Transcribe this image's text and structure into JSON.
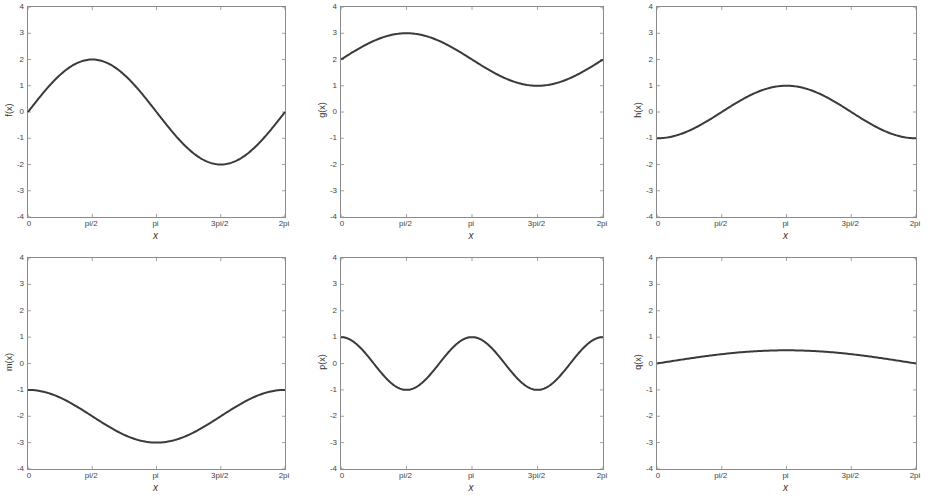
{
  "chart_data": [
    {
      "type": "line",
      "panel": "top-left",
      "ylabel": "f(x)",
      "xlabel": "x",
      "expression": "2*sin(x)",
      "xticks": [
        "0",
        "pi/2",
        "pi",
        "3pi/2",
        "2pi"
      ],
      "yticks": [
        "4",
        "3",
        "2",
        "1",
        "0",
        "-1",
        "-2",
        "-3",
        "-4"
      ],
      "xlim": [
        0,
        6.2832
      ],
      "ylim": [
        -4,
        4
      ],
      "x": [
        0,
        1.5708,
        3.1416,
        4.7124,
        6.2832
      ],
      "values": [
        0,
        2,
        0,
        -2,
        0
      ]
    },
    {
      "type": "line",
      "panel": "top-middle",
      "ylabel": "g(x)",
      "xlabel": "x",
      "expression": "2+sin(x)",
      "xticks": [
        "0",
        "pi/2",
        "pi",
        "3pi/2",
        "2pi"
      ],
      "yticks": [
        "4",
        "3",
        "2",
        "1",
        "0",
        "-1",
        "-2",
        "-3",
        "-4"
      ],
      "xlim": [
        0,
        6.2832
      ],
      "ylim": [
        -4,
        4
      ],
      "x": [
        0,
        1.5708,
        3.1416,
        4.7124,
        6.2832
      ],
      "values": [
        2,
        3,
        2,
        1,
        2
      ]
    },
    {
      "type": "line",
      "panel": "top-right",
      "ylabel": "h(x)",
      "xlabel": "x",
      "expression": "-cos(x)",
      "xticks": [
        "0",
        "pi/2",
        "pi",
        "3pi/2",
        "2pi"
      ],
      "yticks": [
        "4",
        "3",
        "2",
        "1",
        "0",
        "-1",
        "-2",
        "-3",
        "-4"
      ],
      "xlim": [
        0,
        6.2832
      ],
      "ylim": [
        -4,
        4
      ],
      "x": [
        0,
        1.5708,
        3.1416,
        4.7124,
        6.2832
      ],
      "values": [
        -1,
        0,
        1,
        0,
        -1
      ]
    },
    {
      "type": "line",
      "panel": "bottom-left",
      "ylabel": "m(x)",
      "xlabel": "x",
      "expression": "-2+cos(x)",
      "xticks": [
        "0",
        "pi/2",
        "pi",
        "3pi/2",
        "2pi"
      ],
      "yticks": [
        "4",
        "3",
        "2",
        "1",
        "0",
        "-1",
        "-2",
        "-3",
        "-4"
      ],
      "xlim": [
        0,
        6.2832
      ],
      "ylim": [
        -4,
        4
      ],
      "x": [
        0,
        1.5708,
        3.1416,
        4.7124,
        6.2832
      ],
      "values": [
        -1,
        -2,
        -3,
        -2,
        -1
      ]
    },
    {
      "type": "line",
      "panel": "bottom-middle",
      "ylabel": "p(x)",
      "xlabel": "x",
      "expression": "cos(2x)",
      "xticks": [
        "0",
        "pi/2",
        "pi",
        "3pi/2",
        "2pi"
      ],
      "yticks": [
        "4",
        "3",
        "2",
        "1",
        "0",
        "-1",
        "-2",
        "-3",
        "-4"
      ],
      "xlim": [
        0,
        6.2832
      ],
      "ylim": [
        -4,
        4
      ],
      "x": [
        0,
        1.5708,
        3.1416,
        4.7124,
        6.2832
      ],
      "values": [
        1,
        -1,
        1,
        -1,
        1
      ]
    },
    {
      "type": "line",
      "panel": "bottom-right",
      "ylabel": "q(x)",
      "xlabel": "x",
      "expression": "0.5*sin(x/2)",
      "xticks": [
        "0",
        "pi/2",
        "pi",
        "3pi/2",
        "2pi"
      ],
      "yticks": [
        "4",
        "3",
        "2",
        "1",
        "0",
        "-1",
        "-2",
        "-3",
        "-4"
      ],
      "xlim": [
        0,
        6.2832
      ],
      "ylim": [
        -4,
        4
      ],
      "x": [
        0,
        1.5708,
        3.1416,
        4.7124,
        6.2832
      ],
      "values": [
        0,
        0.35,
        0.5,
        0.35,
        0
      ]
    }
  ],
  "style": {
    "line_color": "#3a3a3a",
    "axes_color": "#8a8a8a",
    "background": "#ffffff"
  }
}
